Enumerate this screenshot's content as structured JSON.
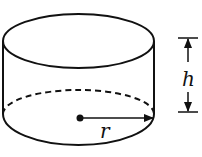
{
  "diagram": {
    "type": "cylinder",
    "labels": {
      "radius": "r",
      "height": "h"
    },
    "colors": {
      "stroke": "#111111",
      "background": "#ffffff"
    }
  }
}
